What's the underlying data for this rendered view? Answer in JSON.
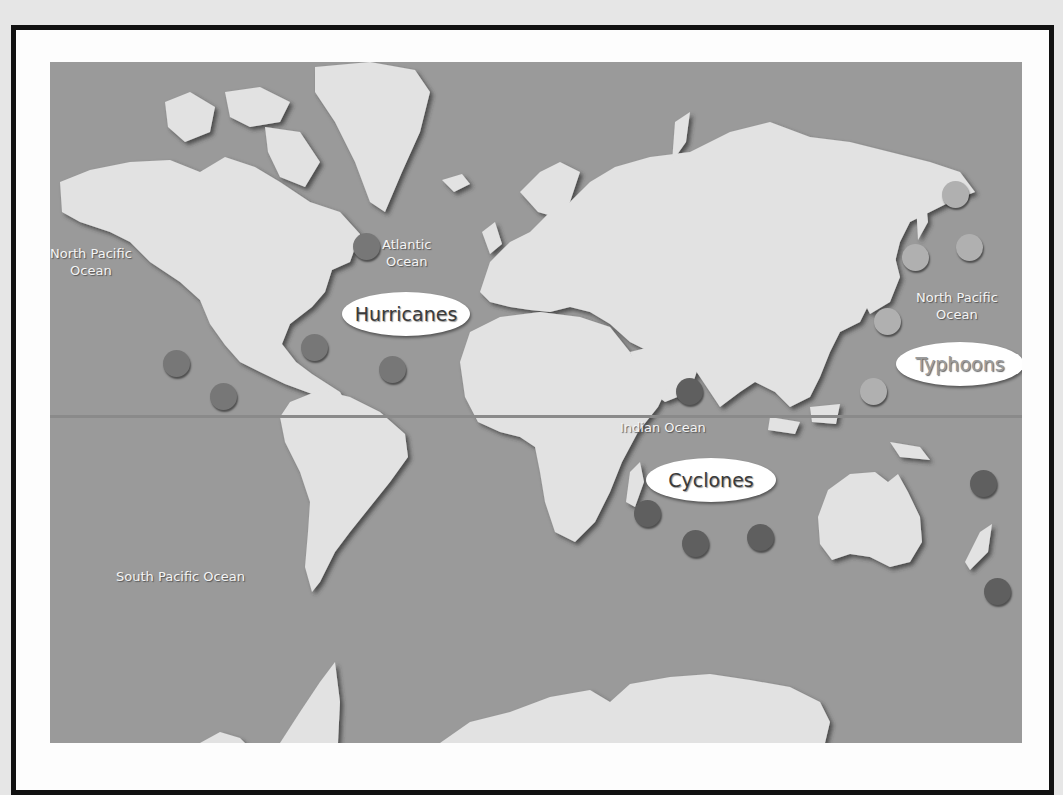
{
  "map": {
    "title": "Tropical storm names by ocean region",
    "colors": {
      "ocean": "#9a9a9a",
      "land": "#e2e2e2",
      "frame": "#111111",
      "hurricane_marker": "#777777",
      "cyclone_marker": "#5f5f5f",
      "typhoon_marker": "#b0b0b0"
    },
    "ocean_labels": [
      {
        "id": "north-pacific-west",
        "line1": "North Pacific",
        "line2": "Ocean",
        "x": 0,
        "y": 183
      },
      {
        "id": "atlantic",
        "line1": "Atlantic",
        "line2": "Ocean",
        "x": 332,
        "y": 174
      },
      {
        "id": "north-pacific-east",
        "line1": "North Pacific",
        "line2": "Ocean",
        "x": 866,
        "y": 227
      },
      {
        "id": "indian",
        "line1": "Indian Ocean",
        "line2": "",
        "x": 570,
        "y": 357
      },
      {
        "id": "south-pacific",
        "line1": "South Pacific Ocean",
        "line2": "",
        "x": 66,
        "y": 506
      }
    ],
    "storm_labels": [
      {
        "id": "hurricanes",
        "text": "Hurricanes",
        "x": 292,
        "y": 230,
        "w": 128,
        "h": 44
      },
      {
        "id": "cyclones",
        "text": "Cyclones",
        "x": 596,
        "y": 396,
        "w": 130,
        "h": 44
      },
      {
        "id": "typhoons",
        "text": "Typhoons",
        "x": 846,
        "y": 280,
        "w": 128,
        "h": 44
      }
    ],
    "markers": {
      "hurricanes": [
        {
          "x": 303,
          "y": 171
        },
        {
          "x": 251,
          "y": 272
        },
        {
          "x": 329,
          "y": 294
        },
        {
          "x": 113,
          "y": 288
        },
        {
          "x": 160,
          "y": 321
        }
      ],
      "cyclones": [
        {
          "x": 626,
          "y": 316
        },
        {
          "x": 584,
          "y": 438
        },
        {
          "x": 632,
          "y": 468
        },
        {
          "x": 697,
          "y": 462
        },
        {
          "x": 920,
          "y": 408
        },
        {
          "x": 934,
          "y": 516
        }
      ],
      "typhoons": [
        {
          "x": 892,
          "y": 119
        },
        {
          "x": 906,
          "y": 172
        },
        {
          "x": 852,
          "y": 182
        },
        {
          "x": 824,
          "y": 246
        },
        {
          "x": 810,
          "y": 316
        }
      ]
    }
  }
}
